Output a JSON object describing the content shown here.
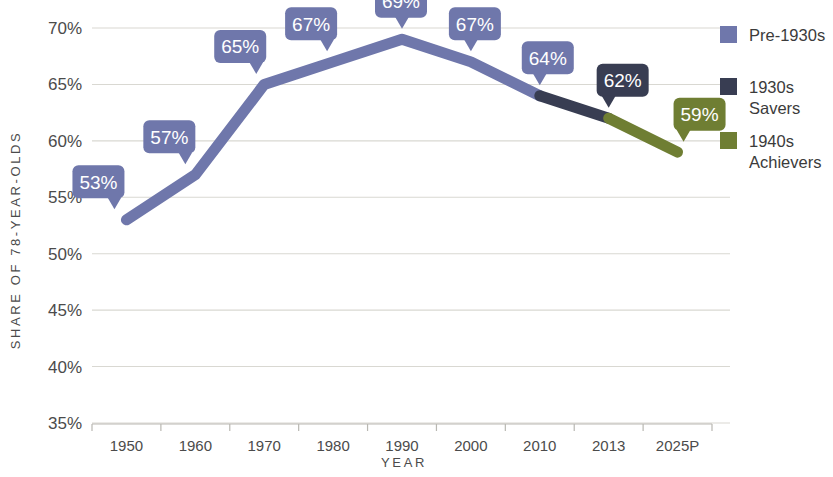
{
  "chart_data": {
    "type": "line",
    "title": "",
    "xlabel": "YEAR",
    "ylabel": "SHARE OF 78-YEAR-OLDS",
    "categories": [
      "1950",
      "1960",
      "1970",
      "1980",
      "1990",
      "2000",
      "2010",
      "2013",
      "2025P"
    ],
    "values": [
      53,
      57,
      65,
      67,
      69,
      67,
      64,
      62,
      59
    ],
    "point_labels": [
      "53%",
      "57%",
      "65%",
      "67%",
      "69%",
      "67%",
      "64%",
      "62%",
      "59%"
    ],
    "ylim": [
      35,
      70
    ],
    "ytick_values": [
      70,
      65,
      60,
      55,
      50,
      45,
      40,
      35
    ],
    "ytick_labels": [
      "70%",
      "65%",
      "60%",
      "55%",
      "50%",
      "45%",
      "40%",
      "35%"
    ],
    "grid": true,
    "legend_position": "right",
    "series": [
      {
        "name": "Pre-1930s",
        "color": "#6f77ab",
        "segment_from": "1950",
        "segment_to": "2010"
      },
      {
        "name": "1930s Savers",
        "name_line1": "1930s",
        "name_line2": "Savers",
        "color": "#383d52",
        "segment_from": "2010",
        "segment_to": "2013"
      },
      {
        "name": "1940s Achievers",
        "name_line1": "1940s",
        "name_line2": "Achievers",
        "color": "#6f7e33",
        "segment_from": "2013",
        "segment_to": "2025P"
      }
    ],
    "label_badge_colors": [
      "#6f77ab",
      "#6f77ab",
      "#6f77ab",
      "#6f77ab",
      "#6f77ab",
      "#6f77ab",
      "#6f77ab",
      "#383d52",
      "#6f7e33"
    ]
  },
  "legend": {
    "items": [
      {
        "label": "Pre-1930s",
        "line1": "Pre-1930s",
        "line2": "",
        "color": "#6f77ab"
      },
      {
        "label": "1930s Savers",
        "line1": "1930s",
        "line2": "Savers",
        "color": "#383d52"
      },
      {
        "label": "1940s Achievers",
        "line1": "1940s",
        "line2": "Achievers",
        "color": "#6f7e33"
      }
    ]
  },
  "axes": {
    "y_title": "SHARE OF 78-YEAR-OLDS",
    "x_title": "YEAR"
  }
}
